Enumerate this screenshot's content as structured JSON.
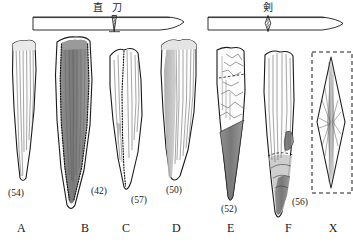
{
  "figure": {
    "type": "archaeological-plate",
    "background_color": "#ffffff",
    "ink_color": "#1a1a1a",
    "shade_color": "#8d8d8d",
    "dark_shade_color": "#6f6f6f",
    "light_shade_color": "#c9c9c9"
  },
  "diagrams": [
    {
      "id": "chokuto",
      "label": "直 刀",
      "label_reading": "chokuto (straight sword)",
      "cross_section": "triangular",
      "blade_shape": "straight-back with curved tip",
      "side": "left"
    },
    {
      "id": "ken",
      "label": "剣",
      "label_reading": "ken (double-edged sword)",
      "cross_section": "lozenge",
      "blade_shape": "straight double-edged, pointed tip",
      "side": "right"
    }
  ],
  "specimens": [
    {
      "letter": "A",
      "number": "(54)",
      "tone": "light",
      "note": "narrow elongated blade, parallel flake scars"
    },
    {
      "letter": "B",
      "number": "(42)",
      "tone": "dark",
      "note": "dark shaded body, dotted outline, white margin"
    },
    {
      "letter": "C",
      "number": "(57)",
      "tone": "light",
      "note": "white body, dotted medial ridge line"
    },
    {
      "letter": "D",
      "number": "(50)",
      "tone": "medium",
      "note": "broad blade, shaded left flank"
    },
    {
      "letter": "E",
      "number": "(52)",
      "tone": "mixed",
      "note": "angular cortex top, dark shaded point"
    },
    {
      "letter": "F",
      "number": "(56)",
      "tone": "mixed",
      "note": "dashed break line, shaded right flank and tip"
    },
    {
      "letter": "X",
      "number": "",
      "tone": "light",
      "note": "lozenge cross-section inside dashed box"
    }
  ],
  "icons": {
    "dashed_box": "dashed-box-icon",
    "section_marker": "cross-section-marker-icon"
  }
}
